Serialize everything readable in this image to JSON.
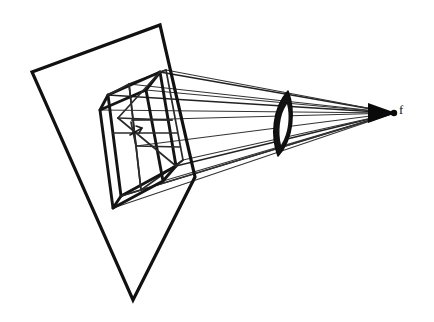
{
  "figure": {
    "background_color": "#ffffff",
    "ink_color": "#111111",
    "width": 434,
    "height": 322,
    "labels": {
      "focal_point": "f"
    },
    "elements": {
      "image_plane_name": "image-plane-quadrilateral",
      "frustum_name": "view-frustum-wireframe",
      "lens_name": "lens-element",
      "focal_point_name": "focal-point",
      "rays_name": "projection-ray-bundle",
      "arrow_name": "principal-axis-arrow"
    }
  },
  "geometry": {
    "image_plane": {
      "corners": [
        [
          32,
          72
        ],
        [
          160,
          25
        ],
        [
          195,
          177
        ],
        [
          133,
          300
        ]
      ],
      "stroke_width": 3.2
    },
    "frustum_near_face": {
      "corners": [
        [
          108,
          95
        ],
        [
          160,
          72
        ],
        [
          176,
          166
        ],
        [
          121,
          196
        ]
      ]
    },
    "frustum_far_face": {
      "corners": [
        [
          100,
          110
        ],
        [
          146,
          90
        ],
        [
          163,
          181
        ],
        [
          113,
          208
        ]
      ]
    },
    "frustum_back_face": {
      "corners": [
        [
          129,
          84
        ],
        [
          166,
          70
        ],
        [
          183,
          160
        ],
        [
          141,
          190
        ]
      ]
    },
    "lens": {
      "center": [
        283,
        123
      ],
      "top": [
        288,
        91
      ],
      "bottom": [
        278,
        156
      ],
      "half_width": 7
    },
    "focal_point": [
      394,
      113
    ],
    "rays": [
      {
        "from": [
          160,
          72
        ],
        "to": [
          394,
          113
        ]
      },
      {
        "from": [
          108,
          95
        ],
        "to": [
          394,
          113
        ]
      },
      {
        "from": [
          100,
          110
        ],
        "to": [
          394,
          113
        ]
      },
      {
        "from": [
          113,
          208
        ],
        "to": [
          394,
          113
        ]
      },
      {
        "from": [
          121,
          196
        ],
        "to": [
          394,
          113
        ]
      },
      {
        "from": [
          176,
          166
        ],
        "to": [
          394,
          113
        ]
      },
      {
        "from": [
          146,
          90
        ],
        "to": [
          394,
          113
        ]
      },
      {
        "from": [
          163,
          181
        ],
        "to": [
          394,
          113
        ]
      },
      {
        "from": [
          129,
          84
        ],
        "to": [
          394,
          113
        ]
      },
      {
        "from": [
          141,
          190
        ],
        "to": [
          394,
          113
        ]
      },
      {
        "from": [
          183,
          160
        ],
        "to": [
          394,
          113
        ]
      },
      {
        "from": [
          166,
          70
        ],
        "to": [
          394,
          113
        ]
      }
    ]
  }
}
